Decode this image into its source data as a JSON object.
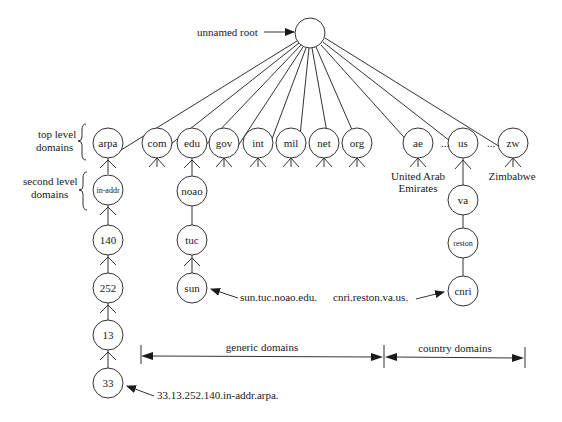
{
  "root": {
    "label": "unnamed root"
  },
  "side_labels": {
    "top_level": [
      "top level",
      "domains"
    ],
    "second_level": [
      "second level",
      "domains"
    ]
  },
  "top_level_domains": [
    "arpa",
    "com",
    "edu",
    "gov",
    "int",
    "mil",
    "net",
    "org",
    "ae",
    "us",
    "zw"
  ],
  "ellipsis": "...",
  "country_names": {
    "ae": [
      "United Arab",
      "Emirates"
    ],
    "zw": [
      "Zimbabwe"
    ]
  },
  "arpa_chain": [
    "in-addr",
    "140",
    "252",
    "13",
    "33"
  ],
  "edu_chain": [
    "noao",
    "tuc",
    "sun"
  ],
  "us_chain": [
    "va",
    "reston",
    "cnri"
  ],
  "annotations": {
    "sun": "sun.tuc.noao.edu.",
    "cnri": "cnri.reston.va.us.",
    "in_addr": "33.13.252.140.in-addr.arpa."
  },
  "ranges": {
    "generic": "generic domains",
    "country": "country domains"
  }
}
